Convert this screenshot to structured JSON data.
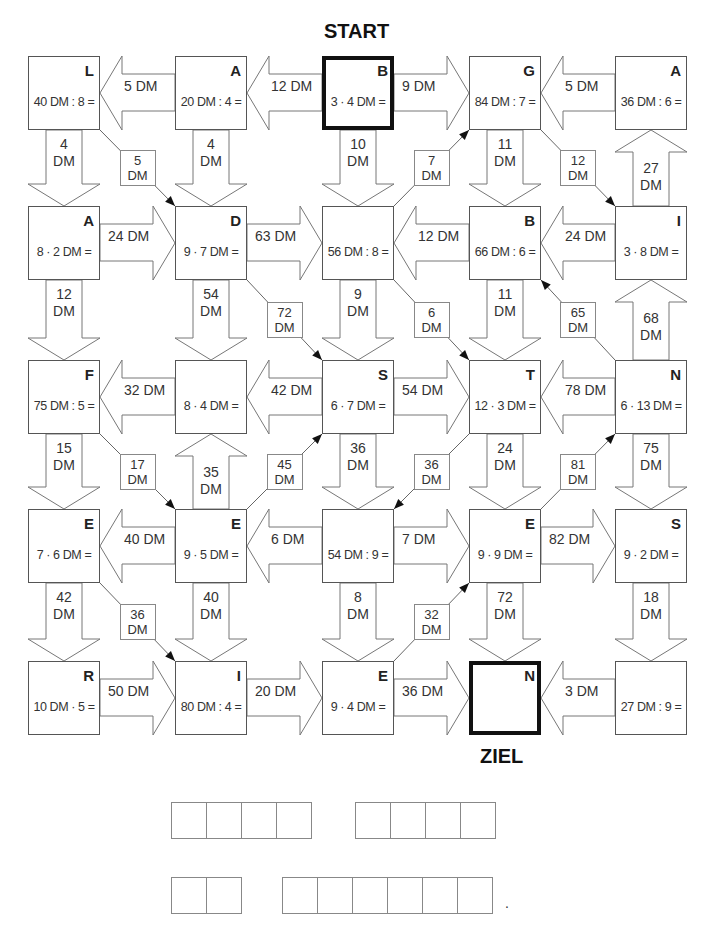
{
  "labels": {
    "start": "START",
    "goal": "ZIEL"
  },
  "boxes": [
    {
      "id": "r0c0",
      "letter": "L",
      "task": "40 DM : 8 ="
    },
    {
      "id": "r0c1",
      "letter": "A",
      "task": "20 DM : 4 ="
    },
    {
      "id": "r0c2",
      "letter": "B",
      "task": "3 · 4 DM =",
      "start": true
    },
    {
      "id": "r0c3",
      "letter": "G",
      "task": "84 DM : 7 ="
    },
    {
      "id": "r0c4",
      "letter": "A",
      "task": "36 DM : 6 ="
    },
    {
      "id": "r1c0",
      "letter": "A",
      "task": "8 · 2 DM ="
    },
    {
      "id": "r1c1",
      "letter": "D",
      "task": "9 · 7 DM ="
    },
    {
      "id": "r1c2",
      "letter": "",
      "task": "56 DM : 8 ="
    },
    {
      "id": "r1c3",
      "letter": "B",
      "task": "66 DM : 6 ="
    },
    {
      "id": "r1c4",
      "letter": "I",
      "task": "3 · 8 DM ="
    },
    {
      "id": "r2c0",
      "letter": "F",
      "task": "75 DM : 5 ="
    },
    {
      "id": "r2c1",
      "letter": "",
      "task": "8 · 4 DM ="
    },
    {
      "id": "r2c2",
      "letter": "S",
      "task": "6 · 7 DM ="
    },
    {
      "id": "r2c3",
      "letter": "T",
      "task": "12 · 3 DM ="
    },
    {
      "id": "r2c4",
      "letter": "N",
      "task": "6 · 13 DM ="
    },
    {
      "id": "r3c0",
      "letter": "E",
      "task": "7 · 6 DM ="
    },
    {
      "id": "r3c1",
      "letter": "E",
      "task": "9 · 5 DM ="
    },
    {
      "id": "r3c2",
      "letter": "",
      "task": "54 DM : 9 ="
    },
    {
      "id": "r3c3",
      "letter": "E",
      "task": "9 · 9 DM ="
    },
    {
      "id": "r3c4",
      "letter": "S",
      "task": "9 · 2 DM ="
    },
    {
      "id": "r4c0",
      "letter": "R",
      "task": "10 DM · 5 ="
    },
    {
      "id": "r4c1",
      "letter": "I",
      "task": "80 DM : 4 ="
    },
    {
      "id": "r4c2",
      "letter": "E",
      "task": "9 · 4 DM ="
    },
    {
      "id": "r4c3",
      "letter": "N",
      "task": "",
      "goal": true
    },
    {
      "id": "r4c4",
      "letter": "",
      "task": "27 DM : 9 ="
    }
  ],
  "horizontal_arrows": [
    {
      "from": "r0c1",
      "to": "r0c0",
      "amount": "5 DM"
    },
    {
      "from": "r0c2",
      "to": "r0c1",
      "amount": "12 DM"
    },
    {
      "from": "r0c2",
      "to": "r0c3",
      "amount": "9 DM"
    },
    {
      "from": "r0c4",
      "to": "r0c3",
      "amount": "5 DM"
    },
    {
      "from": "r1c0",
      "to": "r1c1",
      "amount": "24 DM"
    },
    {
      "from": "r1c1",
      "to": "r1c2",
      "amount": "63 DM"
    },
    {
      "from": "r1c3",
      "to": "r1c2",
      "amount": "12 DM"
    },
    {
      "from": "r1c4",
      "to": "r1c3",
      "amount": "24 DM"
    },
    {
      "from": "r2c1",
      "to": "r2c0",
      "amount": "32 DM"
    },
    {
      "from": "r2c2",
      "to": "r2c1",
      "amount": "42 DM"
    },
    {
      "from": "r2c2",
      "to": "r2c3",
      "amount": "54 DM"
    },
    {
      "from": "r2c4",
      "to": "r2c3",
      "amount": "78 DM"
    },
    {
      "from": "r3c1",
      "to": "r3c0",
      "amount": "40 DM"
    },
    {
      "from": "r3c2",
      "to": "r3c1",
      "amount": "6 DM"
    },
    {
      "from": "r3c2",
      "to": "r3c3",
      "amount": "7 DM"
    },
    {
      "from": "r3c3",
      "to": "r3c4",
      "amount": "82 DM"
    },
    {
      "from": "r4c0",
      "to": "r4c1",
      "amount": "50 DM"
    },
    {
      "from": "r4c1",
      "to": "r4c2",
      "amount": "20 DM"
    },
    {
      "from": "r4c2",
      "to": "r4c3",
      "amount": "36 DM"
    },
    {
      "from": "r4c4",
      "to": "r4c3",
      "amount": "3 DM"
    }
  ],
  "vertical_arrows": [
    {
      "from": "r0c0",
      "to": "r1c0",
      "amount": [
        "4",
        "DM"
      ]
    },
    {
      "from": "r0c1",
      "to": "r1c1",
      "amount": [
        "4",
        "DM"
      ]
    },
    {
      "from": "r0c2",
      "to": "r1c2",
      "amount": [
        "10",
        "DM"
      ]
    },
    {
      "from": "r0c3",
      "to": "r1c3",
      "amount": [
        "11",
        "DM"
      ]
    },
    {
      "from": "r1c4",
      "to": "r0c4",
      "amount": [
        "27",
        "DM"
      ]
    },
    {
      "from": "r1c0",
      "to": "r2c0",
      "amount": [
        "12",
        "DM"
      ]
    },
    {
      "from": "r1c1",
      "to": "r2c1",
      "amount": [
        "54",
        "DM"
      ]
    },
    {
      "from": "r1c2",
      "to": "r2c2",
      "amount": [
        "9",
        "DM"
      ]
    },
    {
      "from": "r1c3",
      "to": "r2c3",
      "amount": [
        "11",
        "DM"
      ]
    },
    {
      "from": "r2c4",
      "to": "r1c4",
      "amount": [
        "68",
        "DM"
      ]
    },
    {
      "from": "r2c0",
      "to": "r3c0",
      "amount": [
        "15",
        "DM"
      ]
    },
    {
      "from": "r3c1",
      "to": "r2c1",
      "amount": [
        "35",
        "DM"
      ]
    },
    {
      "from": "r2c2",
      "to": "r3c2",
      "amount": [
        "36",
        "DM"
      ]
    },
    {
      "from": "r2c3",
      "to": "r3c3",
      "amount": [
        "24",
        "DM"
      ]
    },
    {
      "from": "r2c4",
      "to": "r3c4",
      "amount": [
        "75",
        "DM"
      ]
    },
    {
      "from": "r3c0",
      "to": "r4c0",
      "amount": [
        "42",
        "DM"
      ]
    },
    {
      "from": "r3c1",
      "to": "r4c1",
      "amount": [
        "40",
        "DM"
      ]
    },
    {
      "from": "r3c2",
      "to": "r4c2",
      "amount": [
        "8",
        "DM"
      ]
    },
    {
      "from": "r3c3",
      "to": "r4c3",
      "amount": [
        "72",
        "DM"
      ]
    },
    {
      "from": "r3c4",
      "to": "r4c4",
      "amount": [
        "18",
        "DM"
      ]
    }
  ],
  "diagonal_arrows": [
    {
      "from": "r0c0",
      "to": "r1c1",
      "amount": [
        "5",
        "DM"
      ]
    },
    {
      "from": "r1c2",
      "to": "r0c3",
      "amount": [
        "7",
        "DM"
      ]
    },
    {
      "from": "r0c3",
      "to": "r1c4",
      "amount": [
        "12",
        "DM"
      ]
    },
    {
      "from": "r1c1",
      "to": "r2c2",
      "amount": [
        "72",
        "DM"
      ]
    },
    {
      "from": "r1c2",
      "to": "r2c3",
      "amount": [
        "6",
        "DM"
      ]
    },
    {
      "from": "r2c4",
      "to": "r1c3",
      "amount": [
        "65",
        "DM"
      ]
    },
    {
      "from": "r2c0",
      "to": "r3c1",
      "amount": [
        "17",
        "DM"
      ]
    },
    {
      "from": "r3c1",
      "to": "r2c2",
      "amount": [
        "45",
        "DM"
      ]
    },
    {
      "from": "r2c3",
      "to": "r3c2",
      "amount": [
        "36",
        "DM"
      ]
    },
    {
      "from": "r3c3",
      "to": "r2c4",
      "amount": [
        "81",
        "DM"
      ]
    },
    {
      "from": "r3c0",
      "to": "r4c1",
      "amount": [
        "36",
        "DM"
      ]
    },
    {
      "from": "r4c2",
      "to": "r3c3",
      "amount": [
        "32",
        "DM"
      ]
    }
  ],
  "answer_rows": [
    {
      "groups": [
        4,
        4
      ]
    },
    {
      "groups": [
        2,
        6
      ],
      "trailing": "."
    }
  ]
}
